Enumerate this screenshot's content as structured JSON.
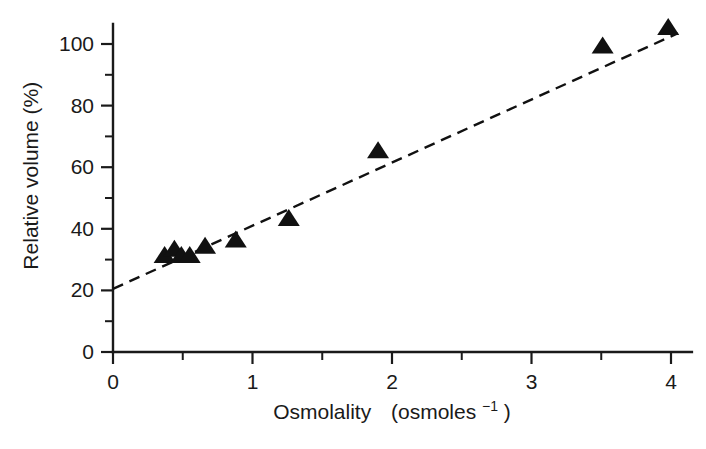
{
  "figure": {
    "background_color": "#ffffff",
    "foreground_color": "#1a1a1a",
    "marker_color": "#111111"
  },
  "axes": {
    "x_label_main": "Osmolality",
    "x_label_units_open": "(osmoles",
    "x_label_units_sup": "−1",
    "x_label_units_close": ")",
    "y_label": "Relative volume  (%)",
    "x_ticks": [
      "0",
      "1",
      "2",
      "3",
      "4"
    ],
    "y_ticks": [
      "0",
      "20",
      "40",
      "60",
      "80",
      "100"
    ]
  },
  "chart_data": {
    "type": "scatter",
    "title": "",
    "xlabel": "Osmolality (osmoles−1)",
    "ylabel": "Relative volume (%)",
    "xlim": [
      0,
      4.15
    ],
    "ylim": [
      0,
      108
    ],
    "xticks": [
      0,
      1,
      2,
      3,
      4
    ],
    "yticks": [
      0,
      20,
      40,
      60,
      80,
      100
    ],
    "xminorticks": [
      0.5,
      1.5,
      2.5,
      3.5
    ],
    "yminorticks": [
      10,
      30,
      50,
      70,
      90
    ],
    "grid": false,
    "legend": false,
    "marker": "triangle-up",
    "series": [
      {
        "name": "Relative volume vs osmolality",
        "points": [
          {
            "x": 0.37,
            "y": 31
          },
          {
            "x": 0.44,
            "y": 33
          },
          {
            "x": 0.49,
            "y": 31
          },
          {
            "x": 0.55,
            "y": 31
          },
          {
            "x": 0.66,
            "y": 34
          },
          {
            "x": 0.88,
            "y": 36
          },
          {
            "x": 1.26,
            "y": 43
          },
          {
            "x": 1.9,
            "y": 65
          },
          {
            "x": 3.51,
            "y": 99
          },
          {
            "x": 3.98,
            "y": 105
          }
        ]
      }
    ],
    "fit_line": {
      "style": "dashed",
      "x_start": 0.0,
      "y_start": 20.5,
      "x_end": 4.05,
      "y_end": 103.5
    }
  }
}
